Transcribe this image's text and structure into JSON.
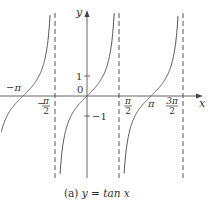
{
  "chart_data": {
    "type": "line",
    "title": "(a) y = tan x",
    "caption_prefix": "(a) ",
    "caption_fn": "y = tan x",
    "xlabel": "x",
    "ylabel": "y",
    "function": "tan(x)",
    "xlim": [
      -4.3,
      5.6
    ],
    "ylim": [
      -4.1,
      4.1
    ],
    "asymptotes": [
      "-π/2",
      "π/2",
      "3π/2"
    ],
    "x_ticks": [
      {
        "value": -3.14159,
        "label": "−π"
      },
      {
        "value": -1.5708,
        "label_num": "π",
        "label_den": "2",
        "sign": "−"
      },
      {
        "value": 1.5708,
        "label_num": "π",
        "label_den": "2",
        "sign": ""
      },
      {
        "value": 3.14159,
        "label": "π"
      },
      {
        "value": 4.7124,
        "label_num": "3π",
        "label_den": "2",
        "sign": ""
      }
    ],
    "y_ticks": [
      {
        "value": 1,
        "label": "1"
      },
      {
        "value": -1,
        "label": "−1"
      },
      {
        "value": 0,
        "label": "0"
      }
    ],
    "series": [
      {
        "name": "branch (-3π/2, -π/2)",
        "x_range": [
          -4.2,
          -1.62
        ]
      },
      {
        "name": "branch (-π/2, π/2)",
        "x_range": [
          -1.45,
          1.45
        ]
      },
      {
        "name": "branch (π/2, 3π/2)",
        "x_range": [
          1.69,
          4.66
        ]
      }
    ],
    "grid": false,
    "colors": {
      "curve": "#555555",
      "axis": "#666666",
      "asymptote": "#555555"
    }
  }
}
